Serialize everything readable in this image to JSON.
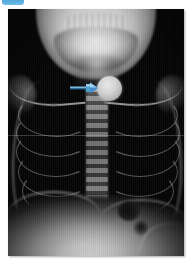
{
  "figure": {
    "label": "",
    "modality": "radiograph",
    "view": "anteroposterior chest and neck",
    "background_color": "#ffffff"
  },
  "badge": {
    "name": "figure-number-badge",
    "text": "",
    "color": "#4ea7dc",
    "clipped_at_top": true
  },
  "xray": {
    "name": "chest-radiograph",
    "plate_color": "#050505",
    "bounds": {
      "x": 8,
      "y": 9,
      "width": 176,
      "height": 247
    },
    "anatomy": [
      {
        "name": "mandible",
        "label": "mandible / jaw",
        "appearance": "bright white"
      },
      {
        "name": "teeth",
        "label": "dentition",
        "appearance": "white serrations"
      },
      {
        "name": "neck-soft-tissue",
        "label": "neck soft tissue column",
        "appearance": "mid gray"
      },
      {
        "name": "clavicle-left",
        "label": "left clavicle",
        "appearance": "thin white band"
      },
      {
        "name": "clavicle-right",
        "label": "right clavicle",
        "appearance": "thin white band"
      },
      {
        "name": "spine",
        "label": "thoracic spine",
        "appearance": "central vertical gray column"
      },
      {
        "name": "rib-cage",
        "label": "ribs",
        "appearance": "faint arcing white lines"
      },
      {
        "name": "lung-fields",
        "label": "lung fields",
        "appearance": "black / radiolucent"
      },
      {
        "name": "diaphragm",
        "label": "hemidiaphragms",
        "appearance": "bright curved border"
      },
      {
        "name": "gastric-bubble",
        "label": "gastric air bubble",
        "appearance": "dark round lucency"
      },
      {
        "name": "abdomen",
        "label": "upper abdomen",
        "appearance": "bright gray"
      }
    ]
  },
  "finding": {
    "name": "coin-foreign-body",
    "label": "radio-opaque coin in upper esophagus",
    "shape": "circle",
    "appearance": "uniform dense gray disc, en-face",
    "center": {
      "x": 101,
      "y": 79
    },
    "diameter_px": 25,
    "color": "#cfcfcf"
  },
  "annotation": {
    "name": "pointer-arrow",
    "type": "arrow",
    "direction": "right",
    "color": "#3f8fd0",
    "highlight_color": "#8fc8ea",
    "points_to": "coin-foreign-body",
    "from": {
      "x": 62,
      "y": 79
    },
    "to": {
      "x": 89,
      "y": 79
    }
  },
  "artifacts": {
    "scanline": {
      "name": "horizontal-scan-line",
      "y": 135
    },
    "striping": {
      "name": "vertical-detector-striping"
    }
  }
}
